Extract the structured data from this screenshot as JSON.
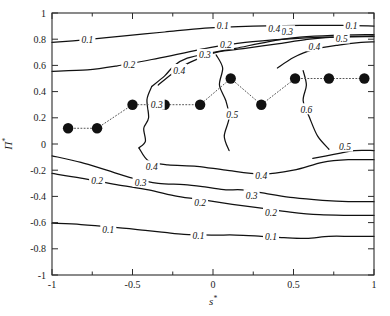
{
  "figure": {
    "title": "",
    "background_color": "#ffffff",
    "line_color": "#111111",
    "marker_color": "#111111"
  },
  "axes": {
    "x": {
      "label_base": "s",
      "label_sup": "*",
      "min": -1,
      "max": 1,
      "ticks": [
        -1,
        -0.5,
        0,
        0.5,
        1
      ],
      "tick_labels": [
        "-1",
        "-0.5",
        "0",
        "0.5",
        "1"
      ],
      "minor_ticks": [
        -0.75,
        -0.25,
        0.25,
        0.75
      ]
    },
    "y": {
      "label_base": "Π",
      "label_sup": "*",
      "min": -1,
      "max": 1,
      "ticks": [
        -1,
        -0.8,
        -0.6,
        -0.4,
        -0.2,
        0,
        0.2,
        0.4,
        0.6,
        0.8,
        1
      ],
      "tick_labels": [
        "-1",
        "-0.8",
        "-0.6",
        "-0.4",
        "-0.2",
        "0",
        "0.2",
        "0.4",
        "0.6",
        "0.8",
        "1"
      ]
    }
  },
  "chart_data": {
    "type": "line",
    "subtype": "contour",
    "title": "",
    "xlabel": "s*",
    "ylabel": "Π*",
    "xlim": [
      -1,
      1
    ],
    "ylim": [
      -1,
      1
    ],
    "grid": false,
    "legend": "none",
    "contour_levels": [
      0.1,
      0.2,
      0.3,
      0.4,
      0.5,
      0.6
    ],
    "contour_lines": [
      {
        "level": 0.1,
        "label": "0.1",
        "label_positions": [
          [
            -0.78,
            0.795
          ],
          [
            0.06,
            0.905
          ],
          [
            0.86,
            0.905
          ]
        ],
        "points": [
          [
            -1.0,
            0.775
          ],
          [
            -0.8,
            0.795
          ],
          [
            -0.55,
            0.825
          ],
          [
            -0.3,
            0.855
          ],
          [
            -0.05,
            0.885
          ],
          [
            0.25,
            0.9
          ],
          [
            0.55,
            0.905
          ],
          [
            0.8,
            0.905
          ],
          [
            1.0,
            0.9
          ]
        ]
      },
      {
        "level": 0.2,
        "label": "0.2",
        "label_positions": [
          [
            -0.52,
            0.605
          ],
          [
            0.08,
            0.76
          ]
        ],
        "points": [
          [
            -1.0,
            0.555
          ],
          [
            -0.78,
            0.565
          ],
          [
            -0.6,
            0.595
          ],
          [
            -0.38,
            0.645
          ],
          [
            -0.2,
            0.69
          ],
          [
            -0.02,
            0.735
          ],
          [
            0.2,
            0.775
          ],
          [
            0.45,
            0.8
          ],
          [
            0.7,
            0.815
          ],
          [
            1.0,
            0.82
          ]
        ]
      },
      {
        "level": 0.3,
        "label": "0.3",
        "label_positions": [
          [
            -0.05,
            0.68
          ],
          [
            0.46,
            0.86
          ]
        ],
        "points": [
          [
            -0.38,
            0.44
          ],
          [
            -0.3,
            0.52
          ],
          [
            -0.24,
            0.6
          ],
          [
            -0.16,
            0.655
          ],
          [
            -0.02,
            0.695
          ],
          [
            0.14,
            0.73
          ],
          [
            0.34,
            0.78
          ],
          [
            0.54,
            0.815
          ],
          [
            0.74,
            0.83
          ],
          [
            1.0,
            0.835
          ]
        ]
      },
      {
        "level": 0.3,
        "label": "0.3",
        "label_positions": [
          [
            -0.35,
            0.3
          ]
        ],
        "points": [
          [
            -0.38,
            0.44
          ],
          [
            -0.41,
            0.34
          ],
          [
            -0.4,
            0.2
          ],
          [
            -0.43,
            0.12
          ],
          [
            -0.42,
            0.02
          ],
          [
            -0.46,
            -0.03
          ]
        ]
      },
      {
        "level": 0.4,
        "label": "0.4",
        "label_positions": [
          [
            -0.21,
            0.565
          ],
          [
            0.38,
            0.88
          ],
          [
            0.63,
            0.745
          ]
        ],
        "points": [
          [
            -0.34,
            0.45
          ],
          [
            -0.24,
            0.55
          ],
          [
            -0.14,
            0.625
          ],
          [
            0.02,
            0.7
          ],
          [
            0.2,
            0.73
          ],
          [
            0.4,
            0.765
          ],
          [
            0.6,
            0.8
          ],
          [
            0.8,
            0.82
          ],
          [
            1.0,
            0.825
          ]
        ]
      },
      {
        "level": 0.5,
        "label": "0.5",
        "label_positions": [
          [
            0.8,
            0.805
          ]
        ],
        "points": [
          [
            0.4,
            0.58
          ],
          [
            0.5,
            0.66
          ],
          [
            0.62,
            0.72
          ],
          [
            0.78,
            0.755
          ],
          [
            0.92,
            0.775
          ],
          [
            1.0,
            0.78
          ]
        ]
      },
      {
        "level": 0.5,
        "label": "0.5",
        "label_positions": [
          [
            0.12,
            0.225
          ]
        ],
        "points": [
          [
            0.02,
            0.68
          ],
          [
            0.06,
            0.58
          ],
          [
            0.04,
            0.45
          ],
          [
            0.08,
            0.33
          ],
          [
            0.1,
            0.2
          ],
          [
            0.07,
            0.06
          ],
          [
            0.1,
            -0.05
          ]
        ]
      },
      {
        "level": 0.6,
        "label": "0.6",
        "label_positions": [
          [
            0.58,
            0.265
          ]
        ],
        "points": [
          [
            0.56,
            0.56
          ],
          [
            0.58,
            0.45
          ],
          [
            0.56,
            0.33
          ],
          [
            0.6,
            0.2
          ],
          [
            0.65,
            0.06
          ],
          [
            0.72,
            -0.04
          ]
        ]
      },
      {
        "level": 0.5,
        "label": "0.5",
        "label_positions": [
          [
            0.82,
            -0.02
          ]
        ],
        "points": [
          [
            0.62,
            -0.11
          ],
          [
            0.75,
            -0.08
          ],
          [
            0.88,
            -0.05
          ],
          [
            1.0,
            -0.05
          ]
        ]
      },
      {
        "level": 0.4,
        "label": "0.4",
        "label_positions": [
          [
            -0.38,
            -0.17
          ],
          [
            0.3,
            -0.24
          ]
        ],
        "points": [
          [
            -0.46,
            -0.03
          ],
          [
            -0.4,
            -0.13
          ],
          [
            -0.28,
            -0.16
          ],
          [
            -0.1,
            -0.17
          ],
          [
            0.08,
            -0.2
          ],
          [
            0.3,
            -0.23
          ],
          [
            0.5,
            -0.2
          ],
          [
            0.68,
            -0.14
          ],
          [
            0.84,
            -0.12
          ],
          [
            1.0,
            -0.12
          ]
        ]
      },
      {
        "level": 0.3,
        "label": "0.3",
        "label_positions": [
          [
            -0.45,
            -0.29
          ],
          [
            0.24,
            -0.39
          ]
        ],
        "points": [
          [
            -1.0,
            -0.09
          ],
          [
            -0.82,
            -0.14
          ],
          [
            -0.66,
            -0.2
          ],
          [
            -0.5,
            -0.26
          ],
          [
            -0.34,
            -0.3
          ],
          [
            -0.18,
            -0.31
          ],
          [
            -0.04,
            -0.33
          ],
          [
            0.08,
            -0.35
          ],
          [
            0.18,
            -0.35
          ],
          [
            0.34,
            -0.38
          ],
          [
            0.5,
            -0.41
          ],
          [
            0.68,
            -0.43
          ],
          [
            0.84,
            -0.44
          ],
          [
            1.0,
            -0.44
          ]
        ]
      },
      {
        "level": 0.2,
        "label": "0.2",
        "label_positions": [
          [
            -0.72,
            -0.275
          ],
          [
            -0.08,
            -0.445
          ],
          [
            0.36,
            -0.52
          ]
        ],
        "points": [
          [
            -1.0,
            -0.225
          ],
          [
            -0.82,
            -0.26
          ],
          [
            -0.6,
            -0.31
          ],
          [
            -0.4,
            -0.35
          ],
          [
            -0.22,
            -0.4
          ],
          [
            -0.04,
            -0.43
          ],
          [
            0.12,
            -0.46
          ],
          [
            0.3,
            -0.49
          ],
          [
            0.48,
            -0.52
          ],
          [
            0.66,
            -0.54
          ],
          [
            0.84,
            -0.545
          ],
          [
            1.0,
            -0.545
          ]
        ]
      },
      {
        "level": 0.1,
        "label": "0.1",
        "label_positions": [
          [
            -0.65,
            -0.655
          ],
          [
            -0.09,
            -0.695
          ],
          [
            0.36,
            -0.705
          ]
        ],
        "points": [
          [
            -1.0,
            -0.605
          ],
          [
            -0.82,
            -0.615
          ],
          [
            -0.62,
            -0.635
          ],
          [
            -0.42,
            -0.66
          ],
          [
            -0.3,
            -0.675
          ],
          [
            -0.18,
            -0.69
          ],
          [
            0.0,
            -0.695
          ],
          [
            0.14,
            -0.695
          ],
          [
            0.3,
            -0.705
          ],
          [
            0.44,
            -0.715
          ],
          [
            0.58,
            -0.72
          ],
          [
            0.72,
            -0.705
          ],
          [
            0.86,
            -0.705
          ],
          [
            1.0,
            -0.705
          ]
        ]
      }
    ],
    "series": [
      {
        "name": "optimum-path",
        "style": "dotted-with-filled-circles",
        "marker": "filled-circle",
        "points": [
          {
            "x": -0.9,
            "y": 0.12
          },
          {
            "x": -0.72,
            "y": 0.12
          },
          {
            "x": -0.5,
            "y": 0.3
          },
          {
            "x": -0.3,
            "y": 0.3
          },
          {
            "x": -0.08,
            "y": 0.3
          },
          {
            "x": 0.11,
            "y": 0.5
          },
          {
            "x": 0.3,
            "y": 0.3
          },
          {
            "x": 0.51,
            "y": 0.5
          },
          {
            "x": 0.72,
            "y": 0.5
          },
          {
            "x": 0.94,
            "y": 0.5
          }
        ]
      }
    ]
  }
}
